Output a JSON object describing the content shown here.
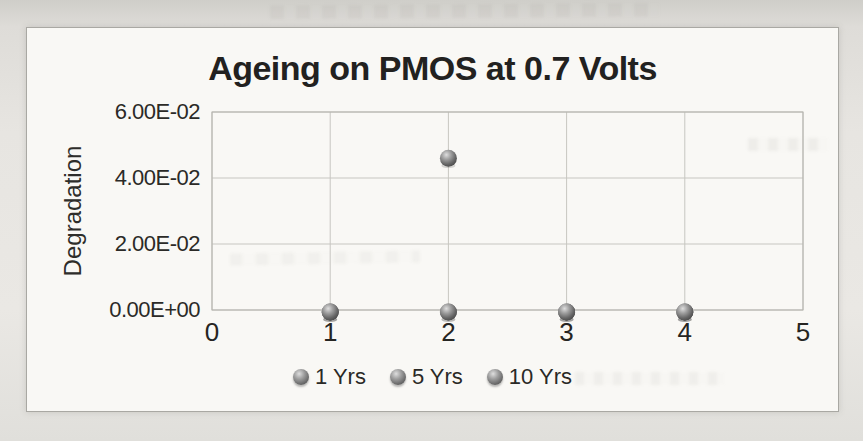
{
  "chart_data": {
    "type": "scatter",
    "title": "Ageing on PMOS at 0.7 Volts",
    "xlabel": "",
    "ylabel": "Degradation",
    "xlim": [
      0,
      5
    ],
    "ylim": [
      0,
      0.06
    ],
    "xticks": [
      0,
      1,
      2,
      3,
      4,
      5
    ],
    "ytick_values": [
      0,
      0.02,
      0.04,
      0.06
    ],
    "ytick_labels": [
      "0.00E+00",
      "2.00E-02",
      "4.00E-02",
      "6.00E-02"
    ],
    "grid": true,
    "legend_position": "bottom",
    "series": [
      {
        "name": "1 Yrs",
        "points": [
          {
            "x": 1,
            "y": 0
          },
          {
            "x": 2,
            "y": 0
          },
          {
            "x": 3,
            "y": 0
          },
          {
            "x": 4,
            "y": 0
          }
        ]
      },
      {
        "name": "5 Yrs",
        "points": [
          {
            "x": 1,
            "y": 0
          },
          {
            "x": 2,
            "y": 0
          },
          {
            "x": 3,
            "y": 0
          },
          {
            "x": 4,
            "y": 0
          }
        ]
      },
      {
        "name": "10 Yrs",
        "points": [
          {
            "x": 1,
            "y": 0
          },
          {
            "x": 2,
            "y": 0.046
          },
          {
            "x": 3,
            "y": 0
          },
          {
            "x": 4,
            "y": 0
          }
        ]
      }
    ],
    "marker": {
      "shape": "sphere",
      "radius_px": 8.5,
      "color": "#7d7d7d"
    }
  },
  "colors": {
    "title_text": "#222120",
    "tick_text": "#2b2a27",
    "gridline": "#c7c6c1",
    "frame_border": "#a9a8a3",
    "paper_background": "#e7e5e1",
    "marker_gray": "#7d7d7d"
  }
}
